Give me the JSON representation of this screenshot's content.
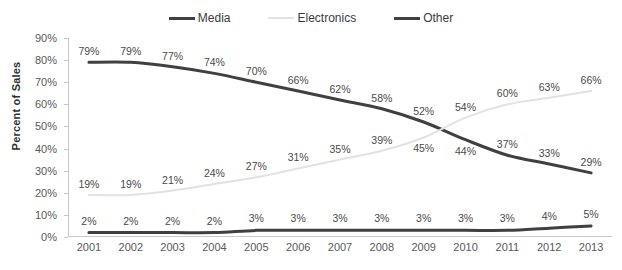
{
  "chart_data": {
    "type": "line",
    "title": "",
    "xlabel": "",
    "ylabel": "Percent of Sales",
    "ylim": [
      0,
      90
    ],
    "ytick_labels": [
      "90%",
      "80%",
      "70%",
      "60%",
      "50%",
      "40%",
      "30%",
      "20%",
      "10%",
      "0%"
    ],
    "ytick_values": [
      90,
      80,
      70,
      60,
      50,
      40,
      30,
      20,
      10,
      0
    ],
    "grid": false,
    "legend_position": "top-center",
    "categories": [
      2001,
      2002,
      2003,
      2004,
      2005,
      2006,
      2007,
      2008,
      2009,
      2010,
      2011,
      2012,
      2013
    ],
    "category_labels": [
      "2001",
      "2002",
      "2003",
      "2004",
      "2005",
      "2006",
      "2007",
      "2008",
      "2009",
      "2010",
      "2011",
      "2012",
      "2013"
    ],
    "series": [
      {
        "name": "Media",
        "color": "#404040",
        "width": 3,
        "values": [
          79,
          79,
          77,
          74,
          70,
          66,
          62,
          58,
          52,
          44,
          37,
          33,
          29
        ],
        "labels": [
          "79%",
          "79%",
          "77%",
          "74%",
          "70%",
          "66%",
          "62%",
          "58%",
          "52%",
          "44%",
          "37%",
          "33%",
          "29%"
        ]
      },
      {
        "name": "Electronics",
        "color": "#e2e2e2",
        "width": 2,
        "values": [
          19,
          19,
          21,
          24,
          27,
          31,
          35,
          39,
          45,
          54,
          60,
          63,
          66
        ],
        "labels": [
          "19%",
          "19%",
          "21%",
          "24%",
          "27%",
          "31%",
          "35%",
          "39%",
          "45%",
          "54%",
          "60%",
          "63%",
          "66%"
        ]
      },
      {
        "name": "Other",
        "color": "#404040",
        "width": 3,
        "values": [
          2,
          2,
          2,
          2,
          3,
          3,
          3,
          3,
          3,
          3,
          3,
          4,
          5
        ],
        "labels": [
          "2%",
          "2%",
          "2%",
          "2%",
          "3%",
          "3%",
          "3%",
          "3%",
          "3%",
          "3%",
          "3%",
          "4%",
          "5%"
        ]
      }
    ]
  },
  "legend": {
    "entries": [
      {
        "label": "Media",
        "color": "#404040"
      },
      {
        "label": "Electronics",
        "color": "#e2e2e2"
      },
      {
        "label": "Other",
        "color": "#404040"
      }
    ]
  }
}
